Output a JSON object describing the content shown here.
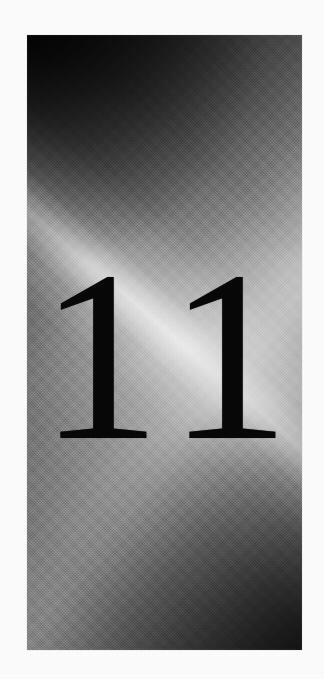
{
  "page": {
    "kind": "scanned-book-chapter-opener",
    "background_color": "#fdfdfd",
    "margin_color": "#ffffff"
  },
  "plate": {
    "name": "gradient-photo-plate",
    "x": 27,
    "y": 35,
    "width": 275,
    "height": 615,
    "description": "Photographic grayscale gradient panel, dark at top-left and bottom-right, light through the middle, with a bright specular diagonal streak running from lower-left to upper-right.",
    "dark_color": "#0a0a0a",
    "mid_color": "#8a8a8a",
    "light_color": "#c3c3c3",
    "highlight_color": "#ffffff",
    "streak_angle_deg": 41,
    "texture": "halftone-dot-scan"
  },
  "chapter": {
    "number": "11",
    "text_color": "#080808"
  }
}
